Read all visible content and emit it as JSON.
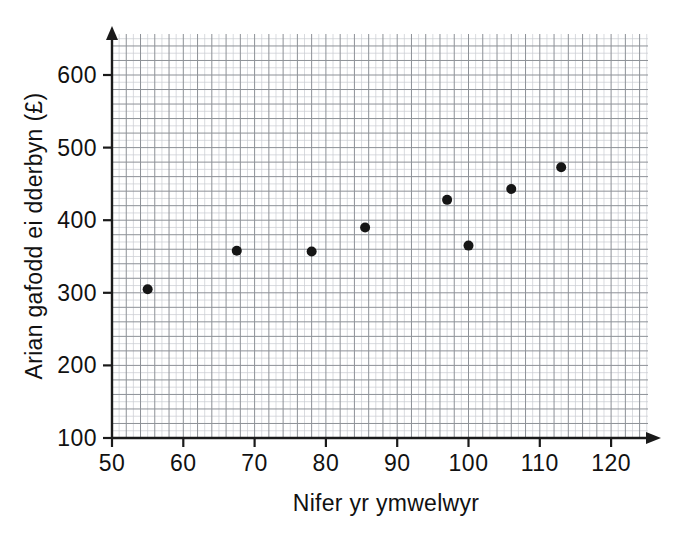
{
  "chart_data": {
    "type": "scatter",
    "title": "",
    "xlabel": "Nifer yr ymwelwyr",
    "ylabel": "Arian gafodd ei dderbyn (£)",
    "xlim": [
      50,
      126
    ],
    "ylim": [
      100,
      655
    ],
    "xticks": [
      50,
      60,
      70,
      80,
      90,
      100,
      110,
      120
    ],
    "yticks": [
      100,
      200,
      300,
      400,
      500,
      600
    ],
    "xtick_labels": [
      "50",
      "60",
      "70",
      "80",
      "90",
      "100",
      "110",
      "120"
    ],
    "ytick_labels": [
      "100",
      "200",
      "300",
      "400",
      "500",
      "600"
    ],
    "grid": true,
    "grid_minor_step_x": 1,
    "grid_minor_step_y": 10,
    "grid_major_step_x": 2,
    "grid_major_step_y": 20,
    "legend": "none",
    "point_color": "#151515",
    "point_radius": 5,
    "x": [
      55,
      67.5,
      78,
      85.5,
      97,
      100,
      106,
      113
    ],
    "y": [
      305,
      358,
      357,
      390,
      428,
      365,
      443,
      473
    ],
    "points": [
      {
        "x": 55,
        "y": 305
      },
      {
        "x": 67.5,
        "y": 358
      },
      {
        "x": 78,
        "y": 357
      },
      {
        "x": 85.5,
        "y": 390
      },
      {
        "x": 97,
        "y": 428
      },
      {
        "x": 100,
        "y": 365
      },
      {
        "x": 106,
        "y": 443
      },
      {
        "x": 113,
        "y": 473
      }
    ]
  },
  "axis": {
    "x_title": "Nifer yr ymwelwyr",
    "y_title": "Arian gafodd ei dderbyn (£)"
  }
}
